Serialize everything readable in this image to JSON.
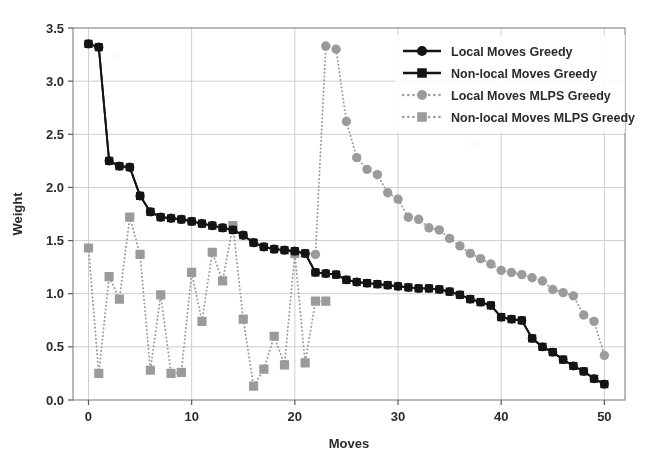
{
  "chart_data": {
    "type": "line",
    "title": "",
    "xlabel": "Moves",
    "ylabel": "Weight",
    "xlim": [
      -1.5,
      52
    ],
    "ylim": [
      0.0,
      3.5
    ],
    "xticks": [
      0,
      10,
      20,
      30,
      40,
      50
    ],
    "yticks": [
      0.0,
      0.5,
      1.0,
      1.5,
      2.0,
      2.5,
      3.0,
      3.5
    ],
    "xtick_labels": [
      "0",
      "10",
      "20",
      "30",
      "40",
      "50"
    ],
    "ytick_labels": [
      "0.0",
      "0.5",
      "1.0",
      "1.5",
      "2.0",
      "2.5",
      "3.0",
      "3.5"
    ],
    "grid": true,
    "legend_position": "upper right",
    "series": [
      {
        "name": "Local Moves Greedy",
        "color": "#141414",
        "marker": "circle",
        "linestyle": "solid",
        "x": [
          0,
          1,
          2,
          3,
          4,
          5,
          6,
          7,
          8,
          9,
          10,
          11,
          12,
          13,
          14,
          15,
          16,
          17,
          18,
          19,
          20,
          21,
          22,
          23,
          24,
          25,
          26,
          27,
          28,
          29,
          30,
          31,
          32,
          33,
          34,
          35,
          36,
          37,
          38,
          39,
          40,
          41,
          42,
          43,
          44,
          45,
          46,
          47,
          48,
          49,
          50
        ],
        "y": [
          3.35,
          3.32,
          2.25,
          2.2,
          2.19,
          1.92,
          1.77,
          1.72,
          1.71,
          1.7,
          1.68,
          1.66,
          1.64,
          1.62,
          1.6,
          1.55,
          1.48,
          1.44,
          1.42,
          1.41,
          1.4,
          1.38,
          1.2,
          1.19,
          1.18,
          1.13,
          1.11,
          1.1,
          1.09,
          1.08,
          1.07,
          1.06,
          1.05,
          1.05,
          1.04,
          1.02,
          0.99,
          0.95,
          0.92,
          0.89,
          0.78,
          0.76,
          0.75,
          0.58,
          0.5,
          0.45,
          0.38,
          0.32,
          0.27,
          0.2,
          0.15
        ]
      },
      {
        "name": "Non-local Moves Greedy",
        "color": "#141414",
        "marker": "square",
        "linestyle": "solid",
        "x": [
          0,
          1,
          2,
          3,
          4,
          5,
          6,
          7,
          8,
          9,
          10,
          11,
          12,
          13,
          14,
          15,
          16,
          17,
          18,
          19,
          20,
          21,
          22,
          23,
          24,
          25,
          26,
          27,
          28,
          29,
          30,
          31,
          32,
          33,
          34,
          35,
          36,
          37,
          38,
          39,
          40,
          41,
          42,
          43,
          44,
          45,
          46,
          47,
          48,
          49,
          50
        ],
        "y": [
          3.35,
          3.32,
          2.25,
          2.2,
          2.19,
          1.92,
          1.77,
          1.72,
          1.71,
          1.7,
          1.68,
          1.66,
          1.64,
          1.62,
          1.6,
          1.55,
          1.48,
          1.44,
          1.42,
          1.41,
          1.4,
          1.38,
          1.2,
          1.19,
          1.18,
          1.13,
          1.11,
          1.1,
          1.09,
          1.08,
          1.07,
          1.06,
          1.05,
          1.05,
          1.04,
          1.02,
          0.99,
          0.95,
          0.92,
          0.89,
          0.78,
          0.76,
          0.75,
          0.58,
          0.5,
          0.45,
          0.38,
          0.32,
          0.27,
          0.2,
          0.15
        ]
      },
      {
        "name": "Local Moves MLPS Greedy",
        "color": "#9b9b9b",
        "marker": "circle",
        "linestyle": "dotted",
        "x": [
          0,
          1,
          2,
          3,
          4,
          5,
          6,
          7,
          8,
          9,
          10,
          11,
          12,
          13,
          14,
          15,
          16,
          17,
          18,
          19,
          20,
          21,
          22,
          23,
          24,
          25,
          26,
          27,
          28,
          29,
          30,
          31,
          32,
          33,
          34,
          35,
          36,
          37,
          38,
          39,
          40,
          41,
          42,
          43,
          44,
          45,
          46,
          47,
          48,
          49,
          50
        ],
        "y": [
          3.35,
          3.32,
          2.25,
          2.2,
          2.19,
          1.92,
          1.77,
          1.72,
          1.71,
          1.7,
          1.68,
          1.66,
          1.64,
          1.62,
          1.6,
          1.55,
          1.48,
          1.44,
          1.42,
          1.41,
          1.4,
          1.38,
          1.37,
          3.33,
          3.3,
          2.62,
          2.28,
          2.17,
          2.12,
          1.95,
          1.89,
          1.72,
          1.7,
          1.62,
          1.6,
          1.52,
          1.45,
          1.38,
          1.33,
          1.28,
          1.22,
          1.2,
          1.18,
          1.15,
          1.12,
          1.04,
          1.01,
          0.98,
          0.8,
          0.74,
          0.42
        ]
      },
      {
        "name": "Non-local Moves MLPS Greedy",
        "color": "#9b9b9b",
        "marker": "square",
        "linestyle": "dotted",
        "x": [
          0,
          1,
          2,
          3,
          4,
          5,
          6,
          7,
          8,
          9,
          10,
          11,
          12,
          13,
          14,
          15,
          16,
          17,
          18,
          19,
          20,
          21,
          22,
          23
        ],
        "y": [
          1.43,
          0.25,
          1.16,
          0.95,
          1.72,
          1.37,
          0.28,
          0.99,
          0.25,
          0.26,
          1.2,
          0.74,
          1.39,
          1.12,
          1.64,
          0.76,
          0.13,
          0.29,
          0.6,
          0.33,
          1.38,
          0.35,
          0.93,
          0.93
        ]
      }
    ]
  },
  "legend": {
    "entries": [
      {
        "label": "Local Moves Greedy",
        "color": "#141414",
        "marker": "circle",
        "linestyle": "solid"
      },
      {
        "label": "Non-local Moves Greedy",
        "color": "#141414",
        "marker": "square",
        "linestyle": "solid"
      },
      {
        "label": "Local Moves MLPS Greedy",
        "color": "#9b9b9b",
        "marker": "circle",
        "linestyle": "dotted"
      },
      {
        "label": "Non-local Moves MLPS Greedy",
        "color": "#9b9b9b",
        "marker": "square",
        "linestyle": "dotted"
      }
    ]
  },
  "colors": {
    "greedy": "#141414",
    "mlps": "#9b9b9b",
    "grid": "#cfcfcf",
    "frame": "#8c8c8c",
    "background": "#ffffff"
  }
}
